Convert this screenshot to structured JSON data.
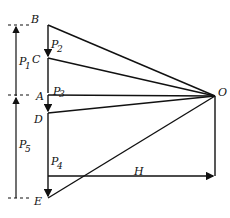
{
  "diagram": {
    "type": "force-polygon-funicular",
    "points": {
      "B": "B",
      "C": "C",
      "A": "A",
      "D": "D",
      "E": "E",
      "O": "O"
    },
    "forces": {
      "P1": "P",
      "P1_sub": "1",
      "P2": "P",
      "P2_sub": "2",
      "P3": "P",
      "P3_sub": "3",
      "P4": "P",
      "P4_sub": "4",
      "P5": "P",
      "P5_sub": "5"
    },
    "pole_distance": "H",
    "colors": {
      "ink": "#111111",
      "background": "#ffffff"
    }
  }
}
